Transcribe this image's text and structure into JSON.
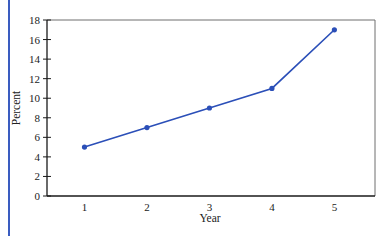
{
  "chart_data": {
    "type": "line",
    "title": "",
    "xlabel": "Year",
    "ylabel": "Percent",
    "x": [
      1,
      2,
      3,
      4,
      5
    ],
    "series": [
      {
        "name": "Percent",
        "values": [
          5,
          7,
          9,
          11,
          17
        ],
        "color": "#2b4fb8"
      }
    ],
    "xticks": [
      "1",
      "2",
      "3",
      "4",
      "5"
    ],
    "yticks": [
      "0",
      "2",
      "4",
      "6",
      "8",
      "10",
      "12",
      "14",
      "16",
      "18"
    ],
    "xlim": [
      0.4,
      5.65
    ],
    "ylim": [
      0,
      18
    ],
    "grid": false,
    "legend": "none",
    "markers": true
  },
  "colors": {
    "accent_rule": "#3a5cc0",
    "axis": "#1a1a1a",
    "frame": "#6e6e6e"
  }
}
